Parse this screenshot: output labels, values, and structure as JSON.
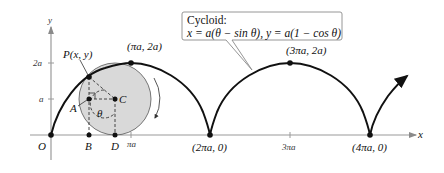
{
  "figure": {
    "callout": {
      "line1": "Cycloid:",
      "line2": "x = a(θ − sin θ), y = a(1 − cos θ)"
    },
    "axes": {
      "x_label": "x",
      "y_label": "y",
      "y_ticks": [
        "2a",
        "a"
      ],
      "x_ticks": [
        "πa",
        "3πa"
      ]
    },
    "points": {
      "P": "P(x, y)",
      "top1": "(πa, 2a)",
      "top2": "(3πa, 2a)",
      "cusp0": "O",
      "cusp1": "(2πa, 0)",
      "cusp2": "(4πa, 0)",
      "A": "A",
      "B": "B",
      "C": "C",
      "D": "D",
      "theta": "θ"
    },
    "colors": {
      "curve": "#111111",
      "circle_fill": "#d9d9d9",
      "axis": "#9a9a9a"
    }
  }
}
